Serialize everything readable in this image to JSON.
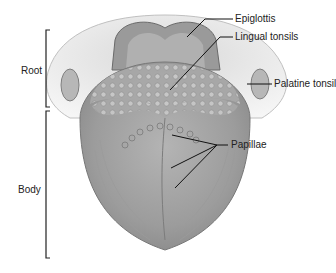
{
  "diagram": {
    "regions": [
      {
        "label": "Root"
      },
      {
        "label": "Body"
      }
    ],
    "callouts": [
      {
        "label": "Epiglottis"
      },
      {
        "label": "Lingual tonsils"
      },
      {
        "label": "Palatine tonsil"
      },
      {
        "label": "Papillae"
      }
    ]
  }
}
